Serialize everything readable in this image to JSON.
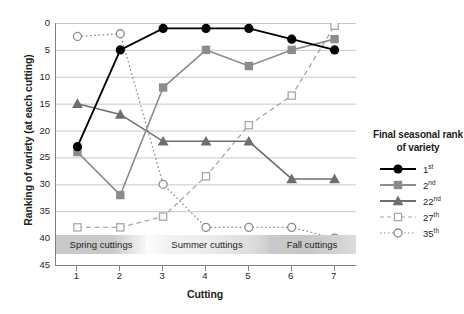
{
  "chart_data": {
    "type": "line",
    "title": "",
    "xlabel": "Cutting",
    "ylabel": "Ranking of variety (at each cutting)",
    "x": [
      1,
      2,
      3,
      4,
      5,
      6,
      7
    ],
    "xticklabels": [
      "1",
      "2",
      "3",
      "4",
      "5",
      "6",
      "7"
    ],
    "yticklabels": [
      "0",
      "5",
      "10",
      "15",
      "20",
      "25",
      "30",
      "35",
      "40",
      "45"
    ],
    "yticks": [
      0,
      5,
      10,
      15,
      20,
      25,
      30,
      35,
      40,
      45
    ],
    "xlim": [
      0.5,
      7.5
    ],
    "ylim": [
      45,
      0
    ],
    "y_axis_inverted": true,
    "grid": "horizontal",
    "legend_position": "right",
    "legend_title": "Final seasonal rank of variety",
    "series": [
      {
        "name": "1st",
        "label_base": "1",
        "label_sup": "st",
        "marker": "filled-circle",
        "line": "solid",
        "color": "#000000",
        "values": [
          23,
          5,
          1,
          1,
          1,
          3,
          5
        ]
      },
      {
        "name": "2nd",
        "label_base": "2",
        "label_sup": "nd",
        "marker": "filled-square",
        "line": "solid",
        "color": "#8c8c8c",
        "values": [
          24,
          32,
          12,
          5,
          8,
          5,
          3
        ]
      },
      {
        "name": "22nd",
        "label_base": "22",
        "label_sup": "nd",
        "marker": "filled-triangle",
        "line": "solid",
        "color": "#6e6e6e",
        "values": [
          15,
          17,
          22,
          22,
          22,
          29,
          29
        ]
      },
      {
        "name": "27th",
        "label_base": "27",
        "label_sup": "th",
        "marker": "open-square",
        "line": "dashed",
        "color": "#a8a8a8",
        "values": [
          38,
          38,
          36,
          28.5,
          19,
          13.5,
          0.5
        ]
      },
      {
        "name": "35th",
        "label_base": "35",
        "label_sup": "th",
        "marker": "open-circle",
        "line": "dotted",
        "color": "#8c8c8c",
        "values": [
          2.5,
          2,
          30,
          38,
          38,
          38,
          40
        ]
      }
    ],
    "season_bands": [
      {
        "label": "Spring cuttings",
        "start": 0.5,
        "end": 2.5
      },
      {
        "label": "Summer cuttings",
        "start": 2.5,
        "end": 5.5
      },
      {
        "label": "Fall cuttings",
        "start": 5.5,
        "end": 7.5
      }
    ]
  }
}
